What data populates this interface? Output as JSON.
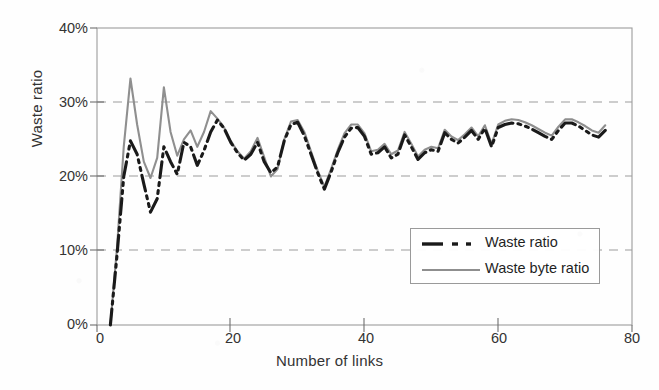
{
  "chart_data": {
    "type": "line",
    "title": "",
    "xlabel": "Number of links",
    "ylabel": "Waste ratio",
    "xlim": [
      0,
      80
    ],
    "ylim": [
      0,
      40
    ],
    "xticks": [
      "0",
      "20",
      "40",
      "60",
      "80"
    ],
    "xtick_values": [
      0,
      20,
      40,
      60,
      80
    ],
    "yticks": [
      "0%",
      "10%",
      "20%",
      "30%",
      "40%"
    ],
    "ytick_values": [
      0,
      10,
      20,
      30,
      40
    ],
    "grid": "horizontal dashed gridlines at 10%, 20%, 30%",
    "legend_position": "inside lower right",
    "x": [
      2,
      3,
      4,
      5,
      6,
      7,
      8,
      9,
      10,
      11,
      12,
      13,
      14,
      15,
      16,
      17,
      18,
      19,
      20,
      21,
      22,
      23,
      24,
      25,
      26,
      27,
      28,
      29,
      30,
      31,
      32,
      33,
      34,
      35,
      36,
      37,
      38,
      39,
      40,
      41,
      42,
      43,
      44,
      45,
      46,
      47,
      48,
      49,
      50,
      51,
      52,
      53,
      54,
      55,
      56,
      57,
      58,
      59,
      60,
      61,
      62,
      63,
      64,
      65,
      66,
      67,
      68,
      69,
      70,
      71,
      72,
      73,
      74,
      75,
      76
    ],
    "series": [
      {
        "name": "Waste ratio",
        "color": "#1a1a1a",
        "style": "dash-dot",
        "width": 3.1,
        "values": [
          0,
          9.5,
          20.0,
          24.8,
          23.0,
          19.0,
          15.2,
          17.0,
          24.0,
          22.0,
          20.3,
          24.6,
          24.0,
          21.5,
          23.5,
          26.0,
          27.6,
          26.5,
          24.6,
          23.2,
          22.2,
          23.0,
          24.6,
          22.0,
          20.5,
          21.3,
          24.8,
          27.0,
          27.3,
          25.5,
          23.0,
          20.5,
          18.3,
          20.6,
          23.2,
          25.3,
          26.5,
          26.6,
          25.4,
          23.0,
          23.2,
          24.0,
          22.5,
          23.0,
          25.6,
          24.0,
          22.3,
          23.2,
          23.6,
          23.4,
          25.9,
          25.0,
          24.5,
          25.3,
          26.2,
          25.0,
          26.5,
          24.0,
          26.6,
          27.0,
          27.2,
          27.1,
          26.8,
          26.4,
          25.9,
          25.4,
          25.0,
          26.2,
          27.2,
          27.2,
          26.8,
          26.2,
          25.6,
          25.3,
          26.2
        ]
      },
      {
        "name": "Waste byte ratio",
        "color": "#8f8f8f",
        "style": "solid",
        "width": 2.1,
        "values": [
          0,
          10.5,
          24.0,
          33.2,
          27.0,
          22.0,
          19.8,
          22.5,
          32.0,
          26.0,
          22.8,
          25.0,
          26.2,
          24.0,
          26.0,
          28.8,
          27.8,
          26.6,
          24.8,
          23.4,
          22.4,
          23.4,
          25.2,
          22.6,
          20.0,
          21.0,
          25.0,
          27.4,
          27.6,
          26.0,
          23.4,
          20.8,
          18.6,
          21.0,
          23.6,
          25.8,
          27.0,
          27.0,
          25.8,
          23.4,
          23.6,
          24.4,
          23.0,
          23.5,
          26.0,
          24.4,
          22.7,
          23.6,
          24.0,
          23.8,
          26.3,
          25.4,
          24.9,
          25.7,
          26.6,
          25.4,
          26.9,
          24.4,
          27.0,
          27.5,
          27.7,
          27.6,
          27.3,
          26.9,
          26.4,
          25.9,
          25.5,
          26.7,
          27.7,
          27.7,
          27.3,
          26.8,
          26.2,
          25.9,
          26.9
        ]
      }
    ]
  },
  "legend": {
    "items": [
      {
        "label": "Waste ratio",
        "color": "#1a1a1a",
        "style": "dash-dot"
      },
      {
        "label": "Waste byte ratio",
        "color": "#8f8f8f",
        "style": "solid"
      }
    ]
  },
  "axes": {
    "ylabel": "Waste ratio",
    "xlabel": "Number of links",
    "ytick_labels": [
      "40%",
      "30%",
      "20%",
      "10%",
      "0%"
    ],
    "xtick_labels": [
      "0",
      "20",
      "40",
      "60",
      "80"
    ]
  }
}
